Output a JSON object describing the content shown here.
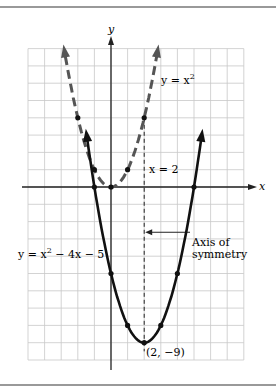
{
  "chart_data": {
    "type": "line",
    "title": "",
    "xlabel": "x",
    "ylabel": "y",
    "xlim": [
      -5,
      8
    ],
    "ylim": [
      -10,
      8
    ],
    "grid": true,
    "series": [
      {
        "name": "y = x^2",
        "style": "dashed",
        "x": [
          -3,
          -2,
          -1,
          0,
          1,
          2,
          3
        ],
        "values": [
          9,
          4,
          1,
          0,
          1,
          4,
          9
        ],
        "marked_points": [
          [
            -2,
            4
          ],
          [
            -1,
            1
          ],
          [
            0,
            0
          ],
          [
            1,
            1
          ],
          [
            2,
            4
          ]
        ]
      },
      {
        "name": "y = x^2 - 4x - 5",
        "style": "solid",
        "x": [
          -1.9,
          -1,
          0,
          1,
          2,
          3,
          4,
          5,
          5.9
        ],
        "values": [
          6.21,
          0,
          -5,
          -8,
          -9,
          -8,
          -5,
          0,
          6.21
        ],
        "marked_points": [
          [
            -1,
            0
          ],
          [
            0,
            -5
          ],
          [
            1,
            -8
          ],
          [
            2,
            -9
          ],
          [
            3,
            -8
          ],
          [
            4,
            -5
          ],
          [
            5,
            0
          ]
        ]
      }
    ],
    "annotations": [
      {
        "text": "y = x²",
        "at": [
          3,
          6
        ]
      },
      {
        "text": "x = 2",
        "at": [
          2.4,
          1.5
        ]
      },
      {
        "text": "Axis of symmetry",
        "arrow_to": [
          2,
          -2.5
        ]
      },
      {
        "text": "y = x² − 4x − 5",
        "at": [
          -5,
          -4
        ]
      },
      {
        "text": "(2, −9)",
        "at": [
          2,
          -9
        ]
      }
    ],
    "axis_of_symmetry": {
      "x": 2,
      "style": "dashed"
    }
  },
  "labels": {
    "x_axis": "x",
    "y_axis": "y",
    "parabola1": "y = x",
    "parabola1_exp": "2",
    "line_x2": "x = 2",
    "axis_line1": "Axis of",
    "axis_line2": "symmetry",
    "parabola2_pre": "y = x",
    "parabola2_exp": "2",
    "parabola2_post": " − 4x − 5",
    "vertex": "(2, −9)"
  }
}
